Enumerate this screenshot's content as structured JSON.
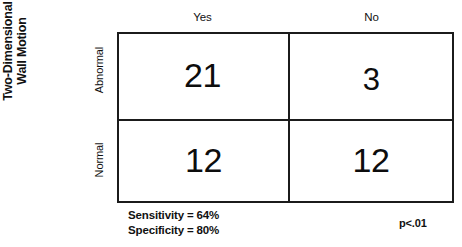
{
  "figure": {
    "row_group_title_line1": "Two-Dimensional",
    "row_group_title_line2": "Wall Motion"
  },
  "chart_data": {
    "type": "table",
    "title": "",
    "xlabel": "",
    "ylabel": "Two-Dimensional Wall Motion",
    "column_headers": [
      "Yes",
      "No"
    ],
    "row_headers": [
      "Abnormal",
      "Normal"
    ],
    "values": [
      [
        21,
        3
      ],
      [
        12,
        12
      ]
    ],
    "cells": {
      "r0c0": "21",
      "r0c1": "3",
      "r1c0": "12",
      "r1c1": "12"
    },
    "annotations": {
      "sensitivity": "Sensitivity = 64%",
      "specificity": "Specificity = 80%",
      "p_value": "p<.01"
    },
    "grid": true,
    "legend_position": "none"
  },
  "colors": {
    "border": "#1b1b1b",
    "text": "#111111",
    "background": "#ffffff"
  }
}
